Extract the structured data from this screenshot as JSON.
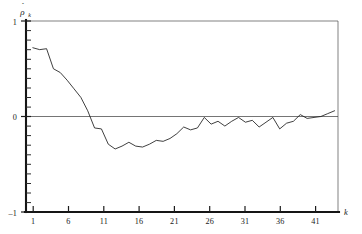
{
  "figure": {
    "title": "",
    "background_color": "#ffffff",
    "line_color": "#1e1e1e",
    "axis_color": "#151515"
  },
  "axes": {
    "y_label": "ρ",
    "y_label_hat": "ˆ",
    "y_label_subscript": "k",
    "x_label": "k",
    "y_ticklabels": [
      "1",
      "0",
      "–1"
    ],
    "y_tick_values": [
      1,
      0,
      -1
    ],
    "y_minor_step": 0.1,
    "x_ticklabels": [
      "1",
      "6",
      "11",
      "16",
      "21",
      "26",
      "31",
      "36",
      "41"
    ],
    "x_tick_values": [
      1,
      6,
      11,
      16,
      21,
      26,
      31,
      36,
      41
    ]
  },
  "chart_data": {
    "type": "line",
    "title": "",
    "subtitle": "",
    "xlabel": "k",
    "ylabel": "rho-hat_k",
    "xlim": [
      0,
      45.5
    ],
    "ylim": [
      -1,
      1
    ],
    "grid": false,
    "legend": null,
    "annotations": [],
    "series": [
      {
        "name": "sample autocorrelation",
        "x": [
          1,
          2,
          3,
          4,
          5,
          6,
          7,
          8,
          9,
          10,
          11,
          12,
          13,
          14,
          15,
          16,
          17,
          18,
          19,
          20,
          21,
          22,
          23,
          24,
          25,
          26,
          27,
          28,
          29,
          30,
          31,
          32,
          33,
          34,
          35,
          36,
          37,
          38,
          39,
          40,
          41,
          42,
          43,
          44,
          45
        ],
        "values": [
          0.72,
          0.7,
          0.71,
          0.5,
          0.46,
          0.38,
          0.29,
          0.2,
          0.06,
          -0.12,
          -0.13,
          -0.29,
          -0.34,
          -0.31,
          -0.27,
          -0.31,
          -0.32,
          -0.29,
          -0.25,
          -0.26,
          -0.23,
          -0.18,
          -0.11,
          -0.14,
          -0.12,
          -0.01,
          -0.08,
          -0.05,
          -0.1,
          -0.05,
          -0.01,
          -0.06,
          -0.04,
          -0.11,
          -0.06,
          -0.01,
          -0.13,
          -0.07,
          -0.05,
          0.02,
          -0.02,
          -0.01,
          0.0,
          0.03,
          0.06
        ]
      }
    ]
  }
}
